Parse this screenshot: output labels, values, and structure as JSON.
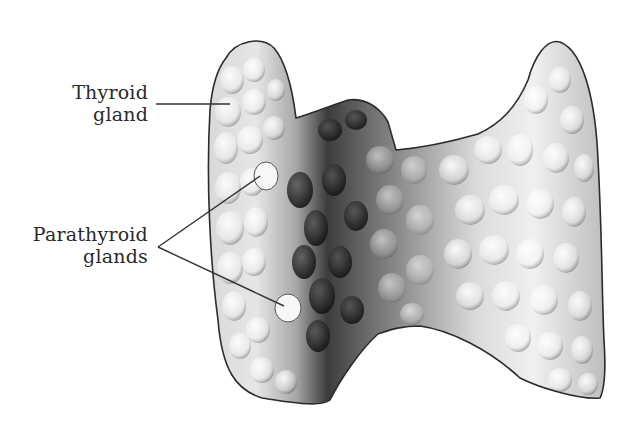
{
  "figure": {
    "labels": [
      {
        "id": "thyroid",
        "line1": "Thyroid",
        "line2": "gland"
      },
      {
        "id": "parathyroid",
        "line1": "Parathyroid",
        "line2": "glands"
      }
    ],
    "colors": {
      "background": "#ffffff",
      "outline": "#2b2b2b",
      "light_tissue": "#e8e8e8",
      "mid_tissue": "#9a9a9a",
      "dark_tissue": "#3a3a3a",
      "label_text": "#2a2a2a"
    }
  }
}
